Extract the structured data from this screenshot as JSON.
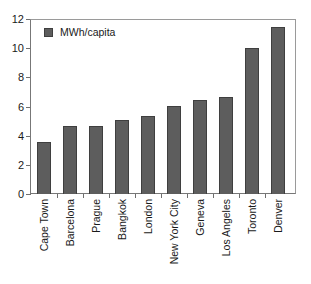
{
  "chart_data": {
    "type": "bar",
    "title": "",
    "subtitle": "",
    "xlabel": "",
    "ylabel": "",
    "categories": [
      "Cape Town",
      "Barcelona",
      "Prague",
      "Bangkok",
      "London",
      "New York City",
      "Geneva",
      "Los Angeles",
      "Toronto",
      "Denver"
    ],
    "series": [
      {
        "name": "MWh/capita",
        "values": [
          3.6,
          4.7,
          4.7,
          5.1,
          5.35,
          6.1,
          6.5,
          6.7,
          10.05,
          11.5
        ],
        "color": "#5d5d5d"
      }
    ],
    "values": [
      3.6,
      4.7,
      4.7,
      5.1,
      5.35,
      6.1,
      6.5,
      6.7,
      10.05,
      11.5
    ],
    "ylim": [
      0,
      12
    ],
    "yticks": [
      0,
      2,
      4,
      6,
      8,
      10,
      12
    ],
    "ytick_labels": [
      "0",
      "2",
      "4",
      "6",
      "8",
      "10",
      "12"
    ],
    "grid": false,
    "legend": {
      "position": "top-left-inside",
      "entries": [
        {
          "label": "MWh/capita",
          "color": "#5d5d5d",
          "swatch": "legend-swatch-square"
        }
      ]
    },
    "annotations": []
  },
  "colors": {
    "bar_fill": "#5d5d5d",
    "bar_edge": "#3f3f3f",
    "axis": "#6f6f6f",
    "frame": "#9a9a9a",
    "text": "#1a1a1a",
    "background": "#ffffff"
  }
}
